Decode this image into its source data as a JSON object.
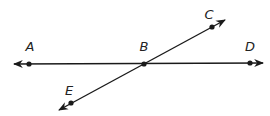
{
  "diagram": {
    "stroke_color": "#1a1a1a",
    "points": [
      {
        "id": "A",
        "label": "A",
        "x": 29,
        "y": 64,
        "lx": 30,
        "ly": 51
      },
      {
        "id": "B",
        "label": "B",
        "x": 144,
        "y": 64,
        "lx": 144,
        "ly": 51
      },
      {
        "id": "D",
        "label": "D",
        "x": 250,
        "y": 63,
        "lx": 250,
        "ly": 51
      },
      {
        "id": "C",
        "label": "C",
        "x": 212,
        "y": 27,
        "lx": 209,
        "ly": 19
      },
      {
        "id": "E",
        "label": "E",
        "x": 71,
        "y": 103,
        "lx": 69,
        "ly": 95
      }
    ],
    "lines": [
      {
        "id": "line-AD",
        "through": [
          "A",
          "B",
          "D"
        ],
        "x1": 14,
        "y1": 64,
        "x2": 263,
        "y2": 63
      },
      {
        "id": "line-CE",
        "through": [
          "C",
          "B",
          "E"
        ],
        "x1": 225,
        "y1": 20,
        "x2": 59,
        "y2": 110
      }
    ]
  }
}
